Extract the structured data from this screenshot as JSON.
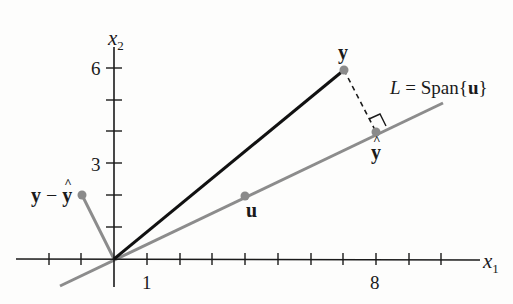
{
  "figure": {
    "axes": {
      "x_label": "x",
      "x_label_sub": "1",
      "y_label": "x",
      "y_label_sub": "2",
      "x_tick_labels": [
        {
          "value": 1,
          "text": "1"
        },
        {
          "value": 8,
          "text": "8"
        }
      ],
      "y_tick_labels": [
        {
          "value": 3,
          "text": "3"
        },
        {
          "value": 6,
          "text": "6"
        }
      ],
      "x_range": [
        -3,
        11
      ],
      "y_range": [
        -1,
        7
      ]
    },
    "labels": {
      "y": "y",
      "y_hat": "y",
      "u": "u",
      "residual_left": "y",
      "residual_minus": " − ",
      "residual_right": "y",
      "line_L": "L",
      "line_eq": " = Span{",
      "line_u": "u",
      "line_close": "}"
    },
    "points": {
      "y": [
        7,
        6
      ],
      "y_hat": [
        8,
        4
      ],
      "u": [
        4,
        2
      ],
      "y_minus_y_hat": [
        -1,
        2
      ]
    },
    "colors": {
      "axis": "#1a1a1a",
      "vector_y": "#111111",
      "line_L": "#8c8c8c",
      "point": "#8a8a8a",
      "residual": "#8c8c8c"
    }
  }
}
